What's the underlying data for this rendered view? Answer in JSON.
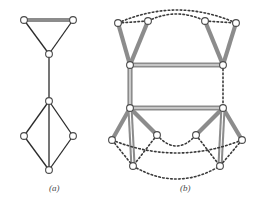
{
  "figure": {
    "caption_a": "(a)",
    "caption_b": "(b)",
    "colors": {
      "thin_edge": "#2b2b2b",
      "thick_edge": "#8c8c8c",
      "dotted_edge": "#3a3a3a",
      "node_fill": "#ffffff",
      "node_stroke": "#4b4b4b",
      "background": "#ffffff"
    },
    "panel_a": {
      "label": "(a)",
      "node_count": 7,
      "nodes": [
        {
          "id": "a1",
          "x": 24,
          "y": 20
        },
        {
          "id": "a2",
          "x": 73,
          "y": 20
        },
        {
          "id": "a3",
          "x": 49,
          "y": 54
        },
        {
          "id": "a4",
          "x": 49,
          "y": 101
        },
        {
          "id": "a5",
          "x": 24,
          "y": 136
        },
        {
          "id": "a6",
          "x": 73,
          "y": 136
        },
        {
          "id": "a7",
          "x": 49,
          "y": 170
        }
      ],
      "edges": [
        {
          "from": "a1",
          "to": "a2",
          "style": "thick"
        },
        {
          "from": "a1",
          "to": "a3",
          "style": "thin"
        },
        {
          "from": "a2",
          "to": "a3",
          "style": "thin"
        },
        {
          "from": "a3",
          "to": "a4",
          "style": "thin"
        },
        {
          "from": "a4",
          "to": "a5",
          "style": "thin"
        },
        {
          "from": "a4",
          "to": "a6",
          "style": "thin"
        },
        {
          "from": "a4",
          "to": "a7",
          "style": "thin"
        },
        {
          "from": "a5",
          "to": "a7",
          "style": "thin"
        },
        {
          "from": "a6",
          "to": "a7",
          "style": "thin"
        }
      ]
    },
    "panel_b": {
      "label": "(b)",
      "node_count": 12,
      "nodes": [
        {
          "id": "b1",
          "x": 118,
          "y": 23
        },
        {
          "id": "b2",
          "x": 148,
          "y": 21
        },
        {
          "id": "b3",
          "x": 205,
          "y": 21
        },
        {
          "id": "b4",
          "x": 236,
          "y": 23
        },
        {
          "id": "b5",
          "x": 130,
          "y": 65
        },
        {
          "id": "b6",
          "x": 223,
          "y": 65
        },
        {
          "id": "b7",
          "x": 130,
          "y": 108
        },
        {
          "id": "b8",
          "x": 223,
          "y": 108
        },
        {
          "id": "b9",
          "x": 157,
          "y": 135
        },
        {
          "id": "b10",
          "x": 196,
          "y": 135
        },
        {
          "id": "b11",
          "x": 112,
          "y": 140
        },
        {
          "id": "b12",
          "x": 242,
          "y": 140
        },
        {
          "id": "b13",
          "x": 133,
          "y": 166
        },
        {
          "id": "b14",
          "x": 220,
          "y": 166
        }
      ],
      "edges": [
        {
          "from": "b1",
          "to": "b5",
          "style": "thick"
        },
        {
          "from": "b2",
          "to": "b5",
          "style": "thick"
        },
        {
          "from": "b3",
          "to": "b6",
          "style": "thick"
        },
        {
          "from": "b4",
          "to": "b6",
          "style": "thick"
        },
        {
          "from": "b5",
          "to": "b6",
          "style": "thick-rail"
        },
        {
          "from": "b5",
          "to": "b7",
          "style": "thick-rail-v"
        },
        {
          "from": "b7",
          "to": "b8",
          "style": "thick-rail"
        },
        {
          "from": "b6",
          "to": "b8",
          "style": "dotted"
        },
        {
          "from": "b1",
          "to": "b2",
          "style": "dotted"
        },
        {
          "from": "b3",
          "to": "b4",
          "style": "dotted"
        },
        {
          "from": "b2",
          "to": "b3",
          "style": "dotted-arc"
        },
        {
          "from": "b1",
          "to": "b4",
          "style": "dotted-arc-wide"
        },
        {
          "from": "b7",
          "to": "b9",
          "style": "thick"
        },
        {
          "from": "b7",
          "to": "b11",
          "style": "thick"
        },
        {
          "from": "b7",
          "to": "b13",
          "style": "thick-rail-v"
        },
        {
          "from": "b8",
          "to": "b10",
          "style": "thick"
        },
        {
          "from": "b8",
          "to": "b12",
          "style": "thick"
        },
        {
          "from": "b8",
          "to": "b14",
          "style": "thick-rail-v"
        },
        {
          "from": "b9",
          "to": "b13",
          "style": "dotted"
        },
        {
          "from": "b10",
          "to": "b14",
          "style": "dotted"
        },
        {
          "from": "b11",
          "to": "b13",
          "style": "dotted"
        },
        {
          "from": "b12",
          "to": "b14",
          "style": "dotted"
        },
        {
          "from": "b9",
          "to": "b10",
          "style": "dotted-arc-down"
        },
        {
          "from": "b11",
          "to": "b12",
          "style": "dotted-arc-down-wide"
        },
        {
          "from": "b13",
          "to": "b14",
          "style": "dotted-arc-down-low"
        }
      ]
    }
  }
}
